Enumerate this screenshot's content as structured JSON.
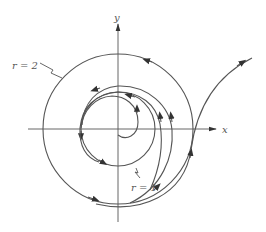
{
  "figure": {
    "type": "phase-portrait",
    "axes": {
      "x_label": "x",
      "y_label": "y",
      "origin_px": [
        118,
        129
      ]
    },
    "limit_cycles": [
      {
        "label": "r = 1",
        "radius": 1,
        "stability": "unstable"
      },
      {
        "label": "r = 2",
        "radius": 2,
        "stability": "semi-stable"
      }
    ],
    "labels": {
      "outer": "r = 2",
      "inner": "r = 1"
    },
    "colors": {
      "stroke": "#555555",
      "arrow": "#333333",
      "background": "#ffffff"
    }
  }
}
